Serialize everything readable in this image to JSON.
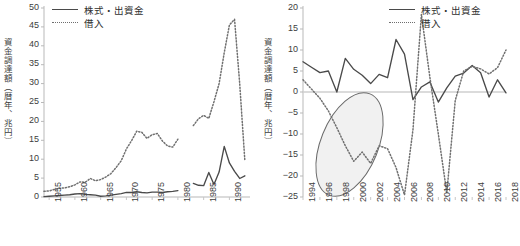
{
  "figure": {
    "background": "#ffffff",
    "series_colors": {
      "equity": "#4a4a4a",
      "borrowing": "#707070",
      "annotation": "#5a5a5a"
    }
  },
  "legend_labels": {
    "equity": "株式・出資金",
    "borrowing": "借入"
  },
  "chart_data": [
    {
      "id": "left",
      "type": "line",
      "title": "",
      "xlabel": "",
      "ylabel": "資金調達額（暦年、兆円）",
      "xlim": [
        1954,
        1994
      ],
      "ylim": [
        0,
        50
      ],
      "ytick_step": 5,
      "yticks": [
        0,
        5,
        10,
        15,
        20,
        25,
        30,
        35,
        40,
        45,
        50
      ],
      "xticks": [
        1955,
        1960,
        1965,
        1970,
        1975,
        1980,
        1985,
        1990
      ],
      "xtick_labels": [
        "1955",
        "1960",
        "1965",
        "1970",
        "1975",
        "1980",
        "1985",
        "1990"
      ],
      "grid": false,
      "legend_position": "top-left",
      "x": [
        1954,
        1955,
        1956,
        1957,
        1958,
        1959,
        1960,
        1961,
        1962,
        1963,
        1964,
        1965,
        1966,
        1967,
        1968,
        1969,
        1970,
        1971,
        1972,
        1973,
        1974,
        1975,
        1976,
        1977,
        1978,
        1979,
        1980,
        1981,
        1982,
        1983,
        1984,
        1985,
        1986,
        1987,
        1988,
        1989,
        1990,
        1991,
        1992,
        1993
      ],
      "series": [
        {
          "name": "株式・出資金",
          "style": "solid",
          "values": [
            0.1,
            0.2,
            0.3,
            0.4,
            0.5,
            0.6,
            0.8,
            0.9,
            0.7,
            0.6,
            0.5,
            0.2,
            0.3,
            0.5,
            0.7,
            0.9,
            1.2,
            1.2,
            1.4,
            1.2,
            1.1,
            1.3,
            1.3,
            1.2,
            1.4,
            1.5,
            1.7,
            null,
            null,
            3.6,
            3.1,
            3.0,
            6.5,
            3.3,
            6.6,
            13.4,
            9.0,
            6.8,
            4.9,
            5.6
          ]
        },
        {
          "name": "借入",
          "style": "dotted",
          "values": [
            1.5,
            1.6,
            2.0,
            2.3,
            2.4,
            2.7,
            3.2,
            4.0,
            3.9,
            4.9,
            4.3,
            4.6,
            5.3,
            6.2,
            7.8,
            9.6,
            12.7,
            14.9,
            17.4,
            17.1,
            15.5,
            16.5,
            16.8,
            14.8,
            13.5,
            13.2,
            15.3,
            null,
            null,
            18.9,
            20.7,
            21.6,
            20.8,
            25.2,
            30.0,
            38.2,
            45.5,
            47.0,
            30.0,
            9.6
          ]
        }
      ]
    },
    {
      "id": "right",
      "type": "line",
      "title": "",
      "xlabel": "",
      "ylabel": "資金調達額（暦年、兆円）",
      "xlim": [
        1994,
        2018
      ],
      "ylim": [
        -25,
        20
      ],
      "ytick_step": 5,
      "yticks": [
        -25,
        -20,
        -15,
        -10,
        -5,
        0,
        5,
        10,
        15,
        20
      ],
      "xticks": [
        1994,
        1996,
        1998,
        2000,
        2002,
        2004,
        2006,
        2008,
        2010,
        2012,
        2014,
        2016,
        2018
      ],
      "xtick_labels": [
        "1994",
        "1996",
        "1998",
        "2000",
        "2002",
        "2004",
        "2006",
        "2008",
        "2010",
        "2012",
        "2014",
        "2016",
        "2018"
      ],
      "grid": false,
      "zero_line": true,
      "legend_position": "top-right",
      "annotation": {
        "shape": "ellipse",
        "label": "",
        "x_center": 1999.5,
        "y_center": -12.5,
        "x_radius": 3.4,
        "y_radius": 13.0,
        "rotation_deg": 22,
        "fill": "#efefef",
        "stroke": "#6a6a6a"
      },
      "x": [
        1994,
        1995,
        1996,
        1997,
        1998,
        1999,
        2000,
        2001,
        2002,
        2003,
        2004,
        2005,
        2006,
        2007,
        2008,
        2009,
        2010,
        2011,
        2012,
        2013,
        2014,
        2015,
        2016,
        2017,
        2018
      ],
      "series": [
        {
          "name": "株式・出資金",
          "style": "solid",
          "values": [
            7.2,
            5.9,
            4.6,
            5.0,
            0.0,
            8.0,
            5.4,
            4.0,
            2.0,
            4.2,
            3.4,
            12.5,
            9.0,
            -1.8,
            1.2,
            2.4,
            -2.4,
            1.0,
            3.8,
            4.5,
            6.3,
            4.6,
            -1.2,
            2.9,
            -0.2
          ]
        },
        {
          "name": "借入",
          "style": "dotted",
          "values": [
            2.9,
            0.7,
            -1.5,
            -4.5,
            -8.5,
            -12.8,
            -16.5,
            -14.3,
            -17.0,
            -12.8,
            -13.5,
            -18.0,
            -24.5,
            -9.0,
            18.5,
            3.5,
            -10.0,
            -24.0,
            -2.0,
            5.0,
            6.1,
            5.5,
            4.3,
            5.8,
            10.0,
            11.0
          ]
        }
      ]
    }
  ]
}
